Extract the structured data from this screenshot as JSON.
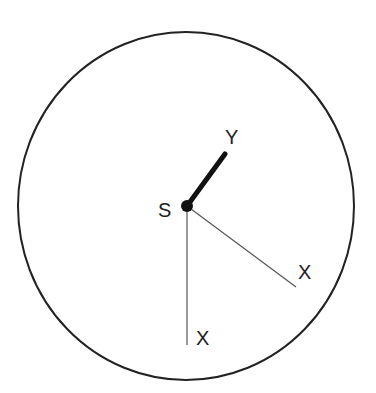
{
  "diagram": {
    "labels": {
      "center": "S",
      "thick_arm": "Y",
      "diagonal_arm": "X",
      "vertical_arm": "X"
    },
    "colors": {
      "stroke": "#222222",
      "thin_stroke": "#555555",
      "background": "#ffffff"
    }
  }
}
